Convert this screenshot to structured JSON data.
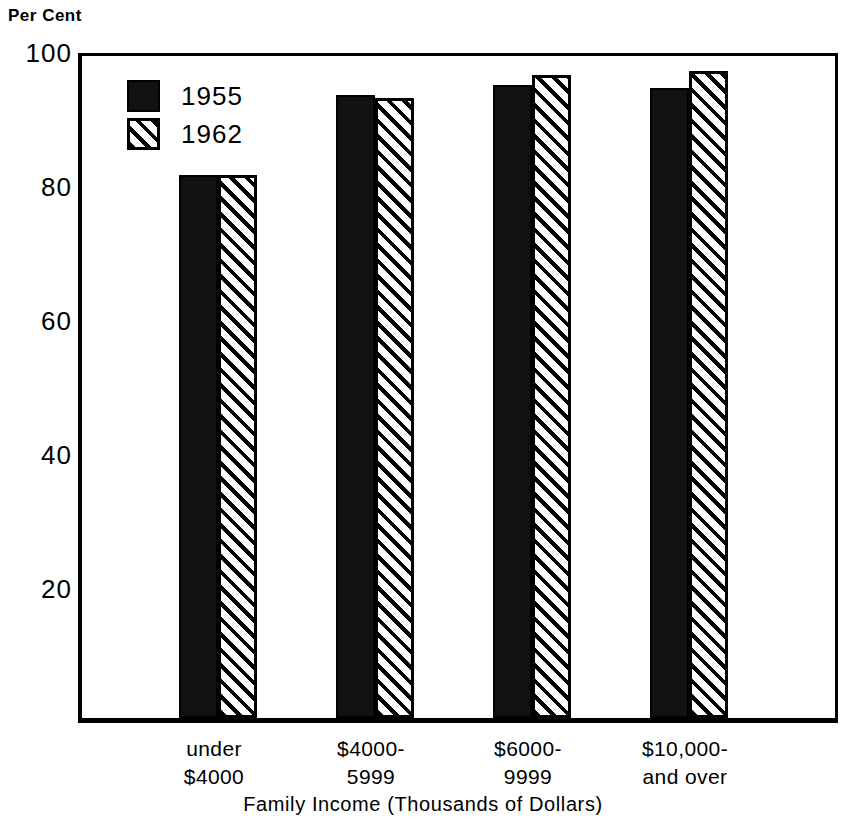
{
  "chart_data": {
    "type": "bar",
    "title": "",
    "xlabel": "Family Income (Thousands of Dollars)",
    "ylabel": "Per Cent",
    "ylim": [
      0,
      100
    ],
    "yticks": [
      20,
      40,
      60,
      80,
      100
    ],
    "grid": false,
    "legend_position": "top-left inside plot",
    "categories": [
      "under $4000",
      "$4000-5999",
      "$6000-9999",
      "$10,000- and over"
    ],
    "category_lines": [
      [
        "under",
        "$4000"
      ],
      [
        "$4000-",
        "5999"
      ],
      [
        "$6000-",
        "9999"
      ],
      [
        "$10,000-",
        "and over"
      ]
    ],
    "series": [
      {
        "name": "1955",
        "fill": "solid-black",
        "color": "#111111",
        "values": [
          81,
          93,
          94.5,
          94
        ]
      },
      {
        "name": "1962",
        "fill": "diagonal-hatch",
        "color": "#000000",
        "values": [
          81,
          92.5,
          96,
          96.5
        ]
      }
    ]
  },
  "axis": {
    "y_caption": "Per Cent",
    "y_tick_labels": [
      "100",
      "80",
      "60",
      "40",
      "20"
    ],
    "x_title": "Family Income (Thousands of Dollars)"
  },
  "legend": {
    "items": [
      {
        "label": "1955",
        "swatch": "solid-black-square-icon"
      },
      {
        "label": "1962",
        "swatch": "hatched-square-icon"
      }
    ]
  }
}
